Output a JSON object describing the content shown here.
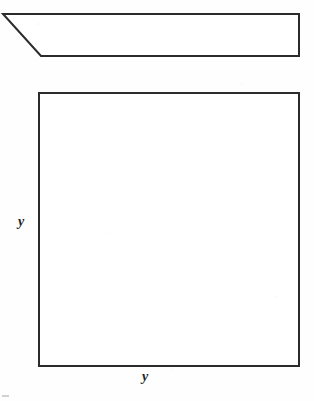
{
  "page": {
    "background_color": "#fefefe",
    "width": 314,
    "height": 401
  },
  "figure": {
    "stroke_color": "#2b2b2b",
    "fill_color": "#ffffff",
    "stroke_width": 2,
    "shapes": [
      {
        "name": "top-trapezoid",
        "kind": "polygon",
        "points": "3,14 299,14 299,56 41,56",
        "description": "elongated trapezoid with a slanted left edge"
      },
      {
        "name": "bottom-square",
        "kind": "polygon",
        "points": "39,93 299,93 299,366 39,366",
        "description": "large square"
      }
    ]
  },
  "labels": {
    "left_side": "y",
    "bottom_side": "y"
  },
  "artifacts": {
    "speck_color": "#c9c9c9"
  }
}
